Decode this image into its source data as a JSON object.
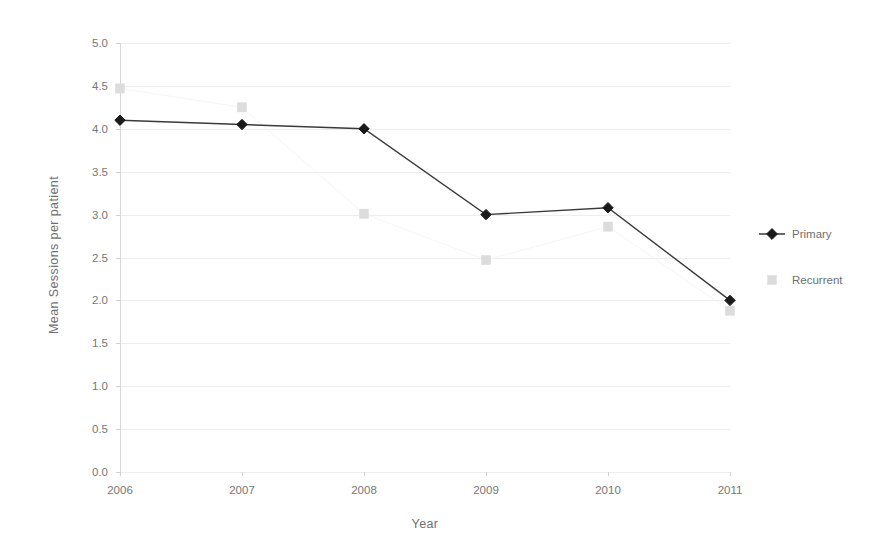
{
  "chart_data": {
    "type": "line",
    "title": "",
    "subtitle": "",
    "xlabel": "Year",
    "ylabel": "Mean Sessions per patient",
    "categories": [
      "2006",
      "2007",
      "2008",
      "2009",
      "2010",
      "2011"
    ],
    "x": [
      2006,
      2007,
      2008,
      2009,
      2010,
      2011
    ],
    "ylim": [
      0.0,
      5.0
    ],
    "ytick_labels": [
      "0.0",
      "0.5",
      "1.0",
      "1.5",
      "2.0",
      "2.5",
      "3.0",
      "3.5",
      "4.0",
      "4.5",
      "5.0"
    ],
    "ytick_values": [
      0.0,
      0.5,
      1.0,
      1.5,
      2.0,
      2.5,
      3.0,
      3.5,
      4.0,
      4.5,
      5.0
    ],
    "grid": true,
    "grid_axis": "y",
    "legend_position": "right",
    "series": [
      {
        "name": "Primary",
        "marker": "diamond",
        "color": "#1a1a1a",
        "line_color": "#3a3a3a",
        "has_line": true,
        "values": [
          4.1,
          4.05,
          4.0,
          3.0,
          3.08,
          2.0
        ]
      },
      {
        "name": "Recurrent",
        "marker": "square",
        "color": "#dcdcdc",
        "line_color": "#f2f2f2",
        "has_line": false,
        "values": [
          4.47,
          4.25,
          3.01,
          2.47,
          2.86,
          1.88
        ]
      }
    ]
  },
  "legend": {
    "items": [
      {
        "label": "Primary"
      },
      {
        "label": "Recurrent"
      }
    ]
  },
  "axes": {
    "x_title": "Year",
    "y_title": "Mean Sessions per patient"
  }
}
